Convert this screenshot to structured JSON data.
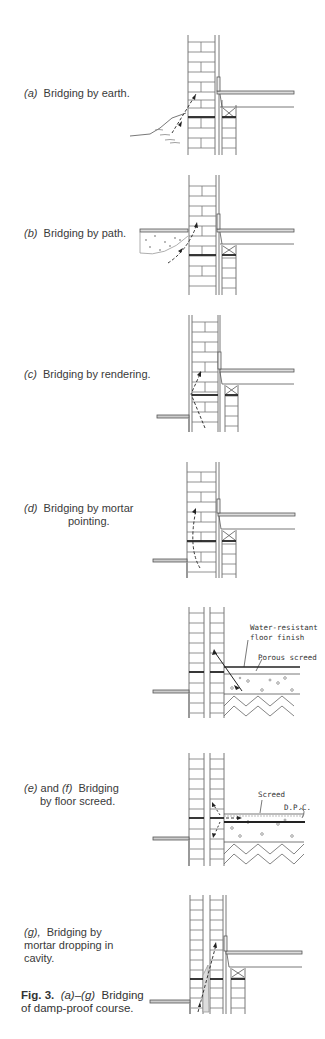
{
  "panels": [
    {
      "id": "a",
      "letter": "(a)",
      "caption": "Bridging by earth.",
      "top": 20
    },
    {
      "id": "b",
      "letter": "(b)",
      "caption": "Bridging by path.",
      "top": 172
    },
    {
      "id": "c",
      "letter": "(c)",
      "caption": "Bridging by rendering.",
      "top": 310
    },
    {
      "id": "d",
      "letter": "(d)",
      "caption_line1": "Bridging by mortar",
      "caption_line2": "pointing.",
      "top": 450
    },
    {
      "id": "e",
      "labels": {
        "finish_line1": "Water-resistant",
        "finish_line2": "floor finish",
        "screed": "Porous screed"
      },
      "top": 600
    },
    {
      "id": "f",
      "letter_e": "(e)",
      "letter_f": "(f)",
      "caption_line1": "and",
      "caption_line1b": "Bridging",
      "caption_line2": "by floor screed.",
      "labels": {
        "screed": "Screed",
        "dpc": "D.P.C."
      },
      "top": 750
    },
    {
      "id": "g",
      "letter": "(g),",
      "caption_line1": "Bridging by",
      "caption_line2": "mortar dropping in",
      "caption_line3": "cavity.",
      "top": 880
    }
  ],
  "figure": {
    "number": "Fig. 3.",
    "range_a": "(a)",
    "dash": "–",
    "range_g": "(g)",
    "title_line1": "Bridging",
    "title_line2": "of damp-proof course."
  }
}
